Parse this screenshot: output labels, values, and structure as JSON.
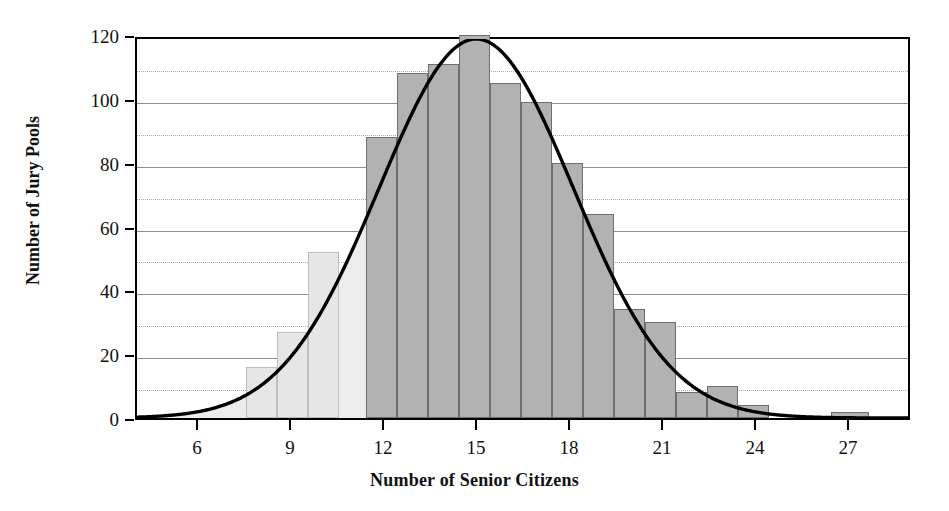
{
  "chart_data": {
    "type": "bar",
    "title": "",
    "xlabel": "Number of Senior Citizens",
    "ylabel": "Number of Jury Pools",
    "xlim": [
      4,
      29
    ],
    "ylim": [
      0,
      120
    ],
    "grid": "horizontal-every-10",
    "legend": "none",
    "x_ticks": [
      6,
      9,
      12,
      15,
      18,
      21,
      24,
      27
    ],
    "x_tick_labels": [
      "6",
      "9",
      "12",
      "15",
      "18",
      "21",
      "24",
      "27"
    ],
    "y_ticks": [
      0,
      20,
      40,
      60,
      80,
      100,
      120
    ],
    "y_tick_labels": [
      "0",
      "20",
      "40",
      "60",
      "80",
      "100",
      "120"
    ],
    "y_gridlines": [
      10,
      20,
      30,
      40,
      50,
      60,
      70,
      80,
      90,
      100,
      110
    ],
    "bin_width": 1,
    "bins": [
      {
        "left": 7.5,
        "right": 8.5,
        "value": 16
      },
      {
        "left": 8.5,
        "right": 9.5,
        "value": 27
      },
      {
        "left": 9.5,
        "right": 10.5,
        "value": 52
      },
      {
        "left": 11.4,
        "right": 12.4,
        "value": 88
      },
      {
        "left": 12.4,
        "right": 13.4,
        "value": 108
      },
      {
        "left": 13.4,
        "right": 14.4,
        "value": 111
      },
      {
        "left": 14.4,
        "right": 15.4,
        "value": 120
      },
      {
        "left": 15.4,
        "right": 16.4,
        "value": 105
      },
      {
        "left": 16.4,
        "right": 17.4,
        "value": 99
      },
      {
        "left": 17.4,
        "right": 18.4,
        "value": 80
      },
      {
        "left": 18.4,
        "right": 19.4,
        "value": 64
      },
      {
        "left": 19.4,
        "right": 20.4,
        "value": 34
      },
      {
        "left": 20.4,
        "right": 21.4,
        "value": 30
      },
      {
        "left": 21.4,
        "right": 22.4,
        "value": 8
      },
      {
        "left": 22.4,
        "right": 23.4,
        "value": 10
      },
      {
        "left": 23.4,
        "right": 24.4,
        "value": 4
      },
      {
        "left": 25.4,
        "right": 26.4,
        "value": 0
      },
      {
        "left": 26.4,
        "right": 27.6,
        "value": 2
      }
    ],
    "overlay_curve": {
      "kind": "normal-density",
      "peak_x": 15,
      "peak_y": 120,
      "sigma": 3.15,
      "color": "#000000"
    },
    "shaded_region": {
      "description": "light shading left of boundary",
      "boundary_x": 11.4,
      "fill": "#ececec"
    },
    "colors": {
      "bar_fill": "#b2b2b2",
      "bar_fill_light": "#e6e6e6",
      "bar_stroke": "#6e6e6e",
      "grid": "#8d8d8d",
      "axis": "#000000",
      "curve": "#000000",
      "text": "#111111"
    }
  }
}
